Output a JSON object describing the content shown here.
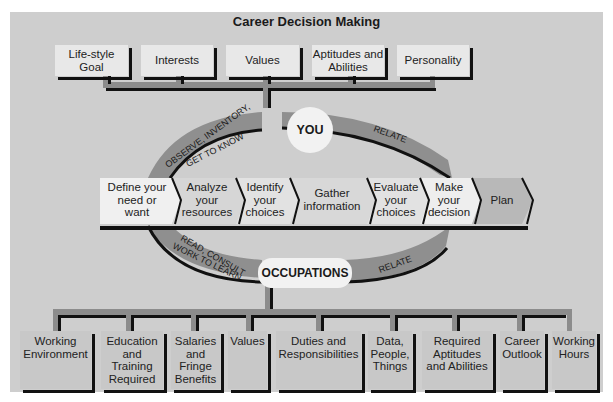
{
  "title": "Career Decision Making",
  "top_factors": [
    {
      "label": "Life-style\nGoal"
    },
    {
      "label": "Interests"
    },
    {
      "label": "Values"
    },
    {
      "label": "Aptitudes and\nAbilities"
    },
    {
      "label": "Personality"
    }
  ],
  "center_nodes": {
    "you": "YOU",
    "occupations": "OCCUPATIONS"
  },
  "arcs": {
    "top_left": [
      "OBSERVE, INVENTORY,",
      "GET TO KNOW"
    ],
    "top_right": "RELATE",
    "bottom_left": [
      "READ, CONSULT",
      "WORK TO LEARN"
    ],
    "bottom_right": "RELATE"
  },
  "steps": [
    {
      "label": "Define your\nneed or\nwant"
    },
    {
      "label": "Analyze\nyour\nresources"
    },
    {
      "label": "Identify\nyour\nchoices"
    },
    {
      "label": "Gather\ninformation"
    },
    {
      "label": "Evaluate\nyour\nchoices"
    },
    {
      "label": "Make\nyour\ndecision"
    },
    {
      "label": "Plan"
    }
  ],
  "occupation_factors": [
    {
      "label": "Working\nEnvironment"
    },
    {
      "label": "Education\nand\nTraining\nRequired"
    },
    {
      "label": "Salaries\nand\nFringe\nBenefits"
    },
    {
      "label": "Values"
    },
    {
      "label": "Duties and\nResponsibilities"
    },
    {
      "label": "Data,\nPeople,\nThings"
    },
    {
      "label": "Required\nAptitudes\nand Abilities"
    },
    {
      "label": "Career\nOutlook"
    },
    {
      "label": "Working\nHours"
    }
  ],
  "colors": {
    "panel": "#cecece",
    "box": "#e8e8e8",
    "box_bottom": "#c8c8c8",
    "connector": "#8c8c8c",
    "arc": "#8f8f8f",
    "node": "#f2f2f2",
    "outline": "#111111"
  }
}
